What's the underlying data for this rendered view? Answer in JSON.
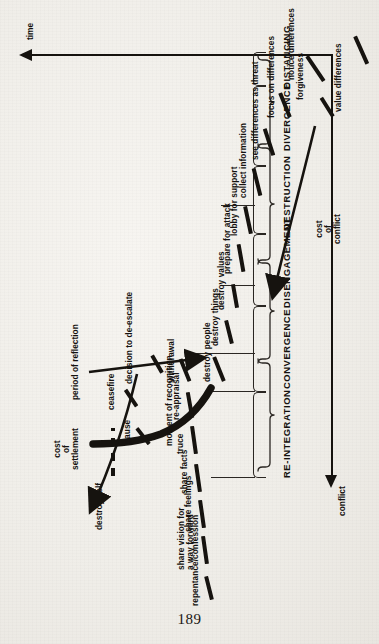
{
  "page": {
    "folio": "189",
    "background_color": "#f1efea",
    "ink_color": "#15120f"
  },
  "figure": {
    "orientation": "rotated-90-ccw",
    "axes": {
      "x_axis_label": "conflict",
      "y_axis_label": "time"
    },
    "annotations": [
      {
        "id": "cost-of-conflict",
        "text": "cost\nof\nconflict",
        "lines": [
          "cost",
          "of",
          "conflict"
        ]
      },
      {
        "id": "cost-of-settlement",
        "text": "cost\nof\nsettlement",
        "lines": [
          "cost",
          "of",
          "settlement"
        ]
      },
      {
        "id": "moment-of-recognition",
        "text": "moment of recognition"
      },
      {
        "id": "period-of-reflection",
        "text": "period of reflection"
      },
      {
        "id": "pause",
        "text": "pause"
      },
      {
        "id": "ceasefire",
        "text": "ceasefire"
      },
      {
        "id": "decision-to-de-escalate",
        "text": "decision to de-escalate"
      },
      {
        "id": "destroy-self",
        "text": "destroy self"
      }
    ],
    "phases": [
      {
        "id": "distancing",
        "label": "DISTANCING"
      },
      {
        "id": "divergence",
        "label": "DIVERGENCE"
      },
      {
        "id": "destruction",
        "label": "DESTRUCTION"
      },
      {
        "id": "disengagement",
        "label": "DISENGAGEMENT"
      },
      {
        "id": "convergence",
        "label": "CONVERGENCE"
      },
      {
        "id": "re-integration",
        "label": "RE-INTEGRATION"
      }
    ],
    "steps_escalation": [
      {
        "id": "notice-differences",
        "label": "notice differences",
        "phase": "distancing"
      },
      {
        "id": "focus-on-differences",
        "label": "focus on differences",
        "phase": "distancing"
      },
      {
        "id": "see-differences-as-threat",
        "label": "see differences as threat",
        "phase": "distancing"
      },
      {
        "id": "collect-information",
        "label": "collect information",
        "phase": "divergence"
      },
      {
        "id": "lobby-for-support",
        "label": "lobby for support",
        "phase": "divergence"
      },
      {
        "id": "prepare-for-attack",
        "label": "prepare for attack",
        "phase": "divergence"
      },
      {
        "id": "destroy-values",
        "label": "destroy values",
        "phase": "destruction"
      },
      {
        "id": "destroy-things",
        "label": "destroy things",
        "phase": "destruction"
      },
      {
        "id": "destroy-people",
        "label": "destroy people",
        "phase": "destruction"
      }
    ],
    "steps_de_escalation": [
      {
        "id": "withdrawal",
        "label": "withdrawal",
        "phase": "disengagement"
      },
      {
        "id": "re-appraisal",
        "label": "re-appraisal",
        "phase": "disengagement"
      },
      {
        "id": "truce",
        "label": "truce",
        "phase": "disengagement"
      },
      {
        "id": "share-facts",
        "label": "share facts",
        "phase": "convergence"
      },
      {
        "id": "share-feelings",
        "label": "share feelings",
        "phase": "convergence"
      },
      {
        "id": "share-vision",
        "label": "share vision for\na way forward",
        "lines": [
          "share vision for",
          "a way forward"
        ],
        "phase": "convergence"
      },
      {
        "id": "repentance-confession",
        "label": "repentance/confession",
        "phase": "re-integration"
      },
      {
        "id": "forgiveness",
        "label": "forgiveness",
        "phase": "re-integration"
      },
      {
        "id": "value-differences",
        "label": "value differences",
        "phase": "re-integration"
      }
    ]
  }
}
